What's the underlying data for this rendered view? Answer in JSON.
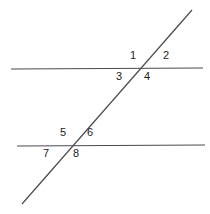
{
  "diagram": {
    "type": "geometry-two-parallel-lines-transversal",
    "background_color": "#ffffff",
    "stroke_color": "#4a4a52",
    "label_color": "#1c1c1c",
    "stroke_width": 1.2,
    "lines": [
      {
        "name": "upper-parallel-line",
        "role": "parallel-line",
        "x1": 11,
        "y1": 69,
        "x2": 203,
        "y2": 68
      },
      {
        "name": "lower-parallel-line",
        "role": "parallel-line",
        "x1": 17,
        "y1": 146,
        "x2": 205,
        "y2": 145
      },
      {
        "name": "transversal-line",
        "role": "transversal",
        "x1": 22,
        "y1": 204,
        "x2": 192,
        "y2": 10
      }
    ],
    "intersections": [
      {
        "name": "upper-intersection",
        "x": 137,
        "y": 69
      },
      {
        "name": "lower-intersection",
        "x": 70,
        "y": 146
      }
    ],
    "angle_labels": [
      {
        "id": "1",
        "text": "1",
        "x": 130,
        "y": 50,
        "position": "upper-left-of-upper-intersection"
      },
      {
        "id": "2",
        "text": "2",
        "x": 163,
        "y": 50,
        "position": "upper-right-of-upper-intersection"
      },
      {
        "id": "3",
        "text": "3",
        "x": 116,
        "y": 71,
        "position": "lower-left-of-upper-intersection"
      },
      {
        "id": "4",
        "text": "4",
        "x": 144,
        "y": 71,
        "position": "lower-right-of-upper-intersection"
      },
      {
        "id": "5",
        "text": "5",
        "x": 60,
        "y": 127,
        "position": "upper-left-of-lower-intersection"
      },
      {
        "id": "6",
        "text": "6",
        "x": 87,
        "y": 127,
        "position": "upper-right-of-lower-intersection"
      },
      {
        "id": "7",
        "text": "7",
        "x": 43,
        "y": 148,
        "position": "lower-left-of-lower-intersection"
      },
      {
        "id": "8",
        "text": "8",
        "x": 73,
        "y": 148,
        "position": "lower-right-of-lower-intersection"
      }
    ]
  }
}
